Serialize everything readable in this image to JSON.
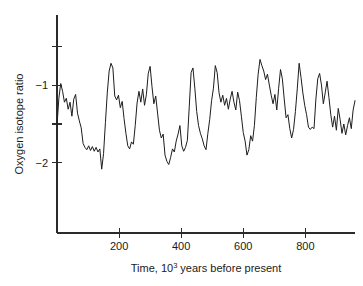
{
  "figure": {
    "background_color": "#ffffff",
    "line_color": "#1d1d1d",
    "axis_color": "#2b2b2b"
  },
  "chart_data": {
    "type": "line",
    "title": "",
    "xlabel_prefix": "Time, 10",
    "xlabel_exponent": "3",
    "xlabel_suffix": " years before present",
    "xlabel": "Time, 10^3 years before present",
    "ylabel": "Oxygen isotope ratio",
    "xlim": [
      0,
      960
    ],
    "ylim": [
      -2.9,
      -0.1
    ],
    "grid": false,
    "legend": false,
    "xticks": [
      200,
      400,
      600,
      800
    ],
    "xtick_labels": [
      "200",
      "400",
      "600",
      "800"
    ],
    "yticks": [
      -0.5,
      -1.0,
      -1.5,
      -2.0
    ],
    "ytick_labels": [
      "",
      "−1",
      "",
      "−2"
    ],
    "series": [
      {
        "name": "Oxygen isotope ratio",
        "x": [
          0,
          6,
          12,
          18,
          24,
          30,
          36,
          42,
          48,
          54,
          60,
          66,
          72,
          78,
          84,
          90,
          96,
          102,
          108,
          114,
          120,
          126,
          132,
          138,
          144,
          150,
          156,
          162,
          168,
          174,
          180,
          186,
          192,
          198,
          204,
          210,
          216,
          222,
          228,
          234,
          240,
          246,
          252,
          258,
          264,
          270,
          276,
          282,
          288,
          294,
          300,
          306,
          312,
          318,
          324,
          330,
          336,
          342,
          348,
          354,
          360,
          366,
          372,
          378,
          384,
          390,
          396,
          402,
          408,
          414,
          420,
          426,
          432,
          438,
          444,
          450,
          456,
          462,
          468,
          474,
          480,
          486,
          492,
          498,
          504,
          510,
          516,
          522,
          528,
          534,
          540,
          546,
          552,
          558,
          564,
          570,
          576,
          582,
          588,
          594,
          600,
          606,
          612,
          618,
          624,
          630,
          636,
          642,
          648,
          654,
          660,
          666,
          672,
          678,
          684,
          690,
          696,
          702,
          708,
          714,
          720,
          726,
          732,
          738,
          744,
          750,
          756,
          762,
          768,
          774,
          780,
          786,
          792,
          798,
          804,
          810,
          816,
          822,
          828,
          834,
          840,
          846,
          852,
          858,
          864,
          870,
          876,
          882,
          888,
          894,
          900,
          906,
          912,
          918,
          924,
          930,
          936,
          942,
          948,
          954,
          960
        ],
        "y": [
          -1.52,
          -1.17,
          -0.98,
          -1.08,
          -1.22,
          -1.17,
          -1.31,
          -1.22,
          -1.4,
          -1.18,
          -1.12,
          -1.36,
          -1.46,
          -1.55,
          -1.75,
          -1.8,
          -1.83,
          -1.78,
          -1.84,
          -1.79,
          -1.85,
          -1.8,
          -1.86,
          -1.82,
          -2.08,
          -1.88,
          -1.48,
          -1.1,
          -0.82,
          -0.72,
          -0.78,
          -1.14,
          -1.19,
          -1.13,
          -1.29,
          -1.21,
          -1.43,
          -1.62,
          -1.78,
          -1.82,
          -1.73,
          -1.76,
          -1.52,
          -1.23,
          -1.08,
          -1.22,
          -1.05,
          -1.26,
          -1.12,
          -0.85,
          -0.76,
          -1.02,
          -1.24,
          -1.14,
          -1.36,
          -1.58,
          -1.68,
          -1.63,
          -1.9,
          -1.98,
          -2.02,
          -1.93,
          -1.82,
          -1.86,
          -1.72,
          -1.63,
          -1.52,
          -1.78,
          -1.85,
          -1.8,
          -1.71,
          -1.28,
          -0.84,
          -0.78,
          -1.04,
          -1.34,
          -1.52,
          -1.62,
          -1.69,
          -1.78,
          -1.83,
          -1.62,
          -1.44,
          -1.2,
          -1.04,
          -0.75,
          -0.84,
          -1.1,
          -1.22,
          -1.13,
          -1.26,
          -1.17,
          -1.31,
          -1.18,
          -1.08,
          -1.22,
          -1.32,
          -1.09,
          -1.2,
          -1.4,
          -1.61,
          -1.72,
          -1.9,
          -1.83,
          -1.65,
          -1.72,
          -1.52,
          -1.16,
          -0.86,
          -0.67,
          -0.75,
          -0.82,
          -0.93,
          -0.86,
          -1.0,
          -1.13,
          -1.24,
          -1.12,
          -1.32,
          -1.04,
          -0.8,
          -0.92,
          -1.18,
          -1.42,
          -1.38,
          -1.56,
          -1.68,
          -1.57,
          -1.34,
          -1.05,
          -0.72,
          -0.9,
          -1.1,
          -1.26,
          -1.38,
          -1.54,
          -1.57,
          -1.54,
          -1.56,
          -1.18,
          -0.92,
          -0.85,
          -1.0,
          -1.24,
          -1.1,
          -0.95,
          -1.16,
          -1.38,
          -1.54,
          -1.4,
          -1.58,
          -1.3,
          -1.44,
          -1.62,
          -1.5,
          -1.64,
          -1.52,
          -1.42,
          -1.56,
          -1.32,
          -1.2
        ]
      }
    ]
  }
}
